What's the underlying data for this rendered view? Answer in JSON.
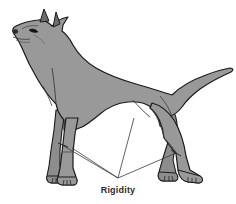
{
  "figure": {
    "background_color": "#ffffff",
    "body_fill_color": "#999999",
    "body_outline_color": "#1a1a1a",
    "shadow_fill_color": "#8a8a8a",
    "leader_line_color": "#3a3a3a",
    "label_text_color": "#2b2b2b"
  },
  "annotations": [
    {
      "id": "rigidity",
      "label": "Rigidity",
      "label_x": 118,
      "label_y": 190,
      "converge_x": 118,
      "converge_y": 178,
      "targets": [
        {
          "name": "front-near-leg-joint",
          "x": 62,
          "y": 145
        },
        {
          "name": "front-far-leg-joint",
          "x": 72,
          "y": 148
        },
        {
          "name": "hind-near-leg-hock",
          "x": 176,
          "y": 153
        },
        {
          "name": "hind-far-stifle",
          "x": 134,
          "y": 118
        }
      ]
    }
  ],
  "anatomy_parts": [
    {
      "name": "head",
      "label": "head"
    },
    {
      "name": "ear-near",
      "label": "ear"
    },
    {
      "name": "ear-far",
      "label": "ear"
    },
    {
      "name": "eye",
      "label": "eye"
    },
    {
      "name": "nose",
      "label": "nose"
    },
    {
      "name": "muzzle",
      "label": "muzzle"
    },
    {
      "name": "neck",
      "label": "neck"
    },
    {
      "name": "withers",
      "label": "withers"
    },
    {
      "name": "back",
      "label": "back"
    },
    {
      "name": "croup",
      "label": "croup"
    },
    {
      "name": "tail",
      "label": "tail"
    },
    {
      "name": "chest",
      "label": "chest"
    },
    {
      "name": "belly",
      "label": "belly"
    },
    {
      "name": "foreleg-near",
      "label": "foreleg"
    },
    {
      "name": "foreleg-far",
      "label": "foreleg"
    },
    {
      "name": "hindleg-near",
      "label": "hindleg"
    },
    {
      "name": "hindleg-far",
      "label": "hindleg"
    },
    {
      "name": "paw-front-near",
      "label": "paw"
    },
    {
      "name": "paw-front-far",
      "label": "paw"
    },
    {
      "name": "paw-hind-near",
      "label": "paw"
    },
    {
      "name": "paw-hind-far",
      "label": "paw"
    }
  ]
}
